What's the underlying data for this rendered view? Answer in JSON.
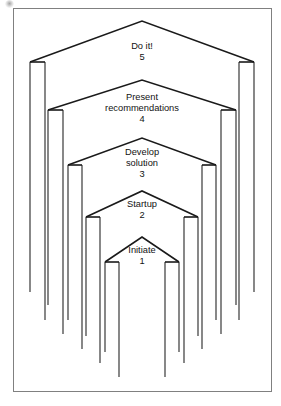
{
  "figure": {
    "border_color": "#808080",
    "line_color": "#1a1a1a",
    "background": "#ffffff",
    "frame": {
      "x": 13,
      "y": 8,
      "width": 259,
      "height": 384
    }
  },
  "chart_data": {
    "type": "diagram",
    "subtype": "nested-chevron-stages",
    "title": "",
    "orientation": "bottom-to-top",
    "stage_count": 5,
    "center_x": 142,
    "categories": [
      "Initiate",
      "Startup",
      "Develop solution",
      "Present recommendations",
      "Do it!"
    ],
    "values": [
      1,
      2,
      3,
      4,
      5
    ],
    "stages": [
      {
        "number": "1",
        "label_lines": [
          "Initiate"
        ],
        "apex_x": 142,
        "apex_y": 237,
        "shoulder_y": 262,
        "outer_x_left": 105,
        "inner_x_left": 119,
        "inner_x_right": 165,
        "outer_x_right": 179,
        "outer_leg_bottom": 352,
        "inner_leg_bottom": 377
      },
      {
        "number": "2",
        "label_lines": [
          "Startup"
        ],
        "apex_x": 142,
        "apex_y": 191,
        "shoulder_y": 217,
        "outer_x_left": 86,
        "inner_x_left": 100,
        "inner_x_right": 184,
        "outer_x_right": 198,
        "outer_leg_bottom": 336,
        "inner_leg_bottom": 363
      },
      {
        "number": "3",
        "label_lines": [
          "Develop",
          "solution"
        ],
        "apex_x": 142,
        "apex_y": 138,
        "shoulder_y": 165,
        "outer_x_left": 68,
        "inner_x_left": 82,
        "inner_x_right": 202,
        "outer_x_right": 216,
        "outer_leg_bottom": 320,
        "inner_leg_bottom": 349
      },
      {
        "number": "4",
        "label_lines": [
          "Present",
          "recommendations"
        ],
        "apex_x": 142,
        "apex_y": 80,
        "shoulder_y": 110,
        "outer_x_left": 48,
        "inner_x_left": 63,
        "inner_x_right": 221,
        "outer_x_right": 236,
        "outer_leg_bottom": 305,
        "inner_leg_bottom": 334
      },
      {
        "number": "5",
        "label_lines": [
          "Do it!"
        ],
        "apex_x": 142,
        "apex_y": 21,
        "shoulder_y": 62,
        "outer_x_left": 30,
        "inner_x_left": 45,
        "inner_x_right": 239,
        "outer_x_right": 254,
        "outer_leg_bottom": 292,
        "inner_leg_bottom": 320
      }
    ],
    "labels": [
      {
        "text": "Do it!",
        "x": 142,
        "y": 49
      },
      {
        "text": "5",
        "x": 142,
        "y": 60
      },
      {
        "text": "Present",
        "x": 142,
        "y": 100
      },
      {
        "text": "recommendations",
        "x": 142,
        "y": 111
      },
      {
        "text": "4",
        "x": 142,
        "y": 122
      },
      {
        "text": "Develop",
        "x": 142,
        "y": 155
      },
      {
        "text": "solution",
        "x": 142,
        "y": 166
      },
      {
        "text": "3",
        "x": 142,
        "y": 177
      },
      {
        "text": "Startup",
        "x": 142,
        "y": 207
      },
      {
        "text": "2",
        "x": 142,
        "y": 218
      },
      {
        "text": "Initiate",
        "x": 142,
        "y": 253
      },
      {
        "text": "1",
        "x": 142,
        "y": 264
      }
    ]
  }
}
